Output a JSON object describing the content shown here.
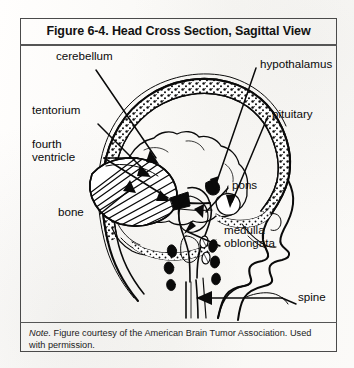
{
  "figure": {
    "title": "Figure 6-4. Head Cross Section, Sagittal View",
    "note_prefix": "Note.",
    "note_body": " Figure courtesy of the American Brain Tumor Association. Used with permission."
  },
  "labels": {
    "cerebellum": "cerebellum",
    "tentorium": "tentorium",
    "fourth_ventricle_line1": "fourth",
    "fourth_ventricle_line2": "ventricle",
    "bone": "bone",
    "hypothalamus": "hypothalamus",
    "pituitary": "pituitary",
    "pons": "pons",
    "medulla_line1": "medulla",
    "medulla_line2": "oblongata",
    "spine": "spine"
  },
  "colors": {
    "ink": "#0a0a0a",
    "frame": "#4a4a4a",
    "paper": "#fdfcfa"
  },
  "diagram": {
    "type": "anatomical-cross-section",
    "structures": [
      "skull bone",
      "cerebrum",
      "cerebellum",
      "tentorium",
      "fourth ventricle",
      "hypothalamus",
      "pituitary",
      "pons",
      "medulla oblongata",
      "spine",
      "vertebrae",
      "face profile"
    ]
  }
}
